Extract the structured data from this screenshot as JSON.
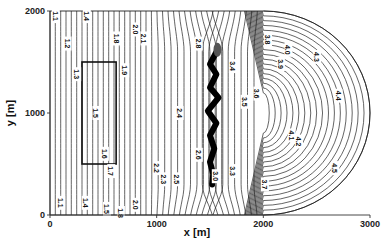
{
  "chart_data": {
    "type": "contour",
    "title": "",
    "xlabel": "x [m]",
    "ylabel": "y [m]",
    "xlim": [
      0,
      3000
    ],
    "ylim": [
      0,
      2000
    ],
    "x_ticks": [
      "0",
      "1000",
      "2000",
      "3000"
    ],
    "y_ticks": [
      "0",
      "1000",
      "2000"
    ],
    "grid": false,
    "domain_shape": "rectangle 0-2000 m in x with semicircular end extending to 3000 m",
    "inner_rectangle": {
      "x": [
        300,
        620
      ],
      "y": [
        500,
        1500
      ]
    },
    "crack_feature": {
      "x_approx": [
        1450,
        1600
      ],
      "y_approx": [
        300,
        1600
      ],
      "color": "#000000"
    },
    "contour_levels": [
      "1.1",
      "1.2",
      "1.3",
      "1.4",
      "1.5",
      "1.6",
      "1.7",
      "1.8",
      "1.9",
      "2.0",
      "2.1",
      "2.2",
      "2.3",
      "2.4",
      "2.5",
      "2.6",
      "2.8",
      "2.9",
      "3.0",
      "3.3",
      "3.4",
      "3.5",
      "3.6",
      "3.7",
      "3.8",
      "3.9",
      "4.0",
      "4.1",
      "4.2",
      "4.3",
      "4.4",
      "4.5"
    ],
    "contour_labels": [
      {
        "text": "1.1",
        "x": 50,
        "y": 1950
      },
      {
        "text": "1.2",
        "x": 160,
        "y": 1680
      },
      {
        "text": "1.3",
        "x": 250,
        "y": 1380
      },
      {
        "text": "1.4",
        "x": 340,
        "y": 1950
      },
      {
        "text": "1.5",
        "x": 430,
        "y": 1000
      },
      {
        "text": "1.6",
        "x": 510,
        "y": 600
      },
      {
        "text": "1.7",
        "x": 570,
        "y": 430
      },
      {
        "text": "1.8",
        "x": 620,
        "y": 1730
      },
      {
        "text": "1.9",
        "x": 700,
        "y": 1420
      },
      {
        "text": "2.0",
        "x": 800,
        "y": 1820
      },
      {
        "text": "2.1",
        "x": 880,
        "y": 1730
      },
      {
        "text": "2.2",
        "x": 1000,
        "y": 460
      },
      {
        "text": "2.3",
        "x": 1060,
        "y": 350
      },
      {
        "text": "2.4",
        "x": 1210,
        "y": 1000
      },
      {
        "text": "2.5",
        "x": 1190,
        "y": 350
      },
      {
        "text": "2.6",
        "x": 1390,
        "y": 590
      },
      {
        "text": "2.8",
        "x": 1390,
        "y": 1680
      },
      {
        "text": "3.0",
        "x": 1550,
        "y": 380
      },
      {
        "text": "3.3",
        "x": 1710,
        "y": 430
      },
      {
        "text": "3.4",
        "x": 1710,
        "y": 1460
      },
      {
        "text": "3.5",
        "x": 1820,
        "y": 1110
      },
      {
        "text": "3.6",
        "x": 1940,
        "y": 1190
      },
      {
        "text": "3.7",
        "x": 2010,
        "y": 300
      },
      {
        "text": "3.8",
        "x": 2040,
        "y": 1720
      },
      {
        "text": "3.9",
        "x": 2160,
        "y": 1480
      },
      {
        "text": "4.0",
        "x": 2230,
        "y": 1620
      },
      {
        "text": "4.1",
        "x": 2260,
        "y": 780
      },
      {
        "text": "4.2",
        "x": 2330,
        "y": 720
      },
      {
        "text": "4.3",
        "x": 2500,
        "y": 1550
      },
      {
        "text": "4.4",
        "x": 2700,
        "y": 1170
      },
      {
        "text": "4.5",
        "x": 2670,
        "y": 460
      },
      {
        "text": "1.1",
        "x": 100,
        "y": 120
      },
      {
        "text": "1.4",
        "x": 330,
        "y": 120
      },
      {
        "text": "1.8",
        "x": 660,
        "y": 20
      },
      {
        "text": "2.0",
        "x": 800,
        "y": 100
      },
      {
        "text": "1.5",
        "x": 530,
        "y": 60
      }
    ]
  }
}
